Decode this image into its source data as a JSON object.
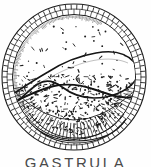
{
  "figure": {
    "title": "GASTRULA",
    "caption": "GASTRULA",
    "style": "black-and-white stippled line engraving",
    "background_color": "#fefefe",
    "ink_color": "#1a1a1a"
  },
  "diagram": {
    "type": "biological-cross-section",
    "outline_shape": "circle",
    "center_x": 74,
    "center_y": 77,
    "radius_x": 72,
    "radius_y": 73,
    "structures": [
      {
        "name": "ectoderm-outer-wall",
        "label": "outer cell layer",
        "description": "double-walled ring of rectangular epithelial cells forming the embryo surface"
      },
      {
        "name": "archenteron-cavity",
        "label": "archenteron",
        "description": "large pale curved interior cavity outlined by a heavy dark line, occupying the upper-left interior"
      },
      {
        "name": "yolk-mass",
        "label": "yolk / endoderm",
        "description": "stippled granular region filling the lower and right interior"
      },
      {
        "name": "blastopore-lip",
        "label": "blastopore",
        "description": "thickened multi-layered cell mass at the bottom of the sphere"
      }
    ],
    "cell_ring": {
      "cell_count": 78,
      "inner_ring_count": 70,
      "wall_thickness": 11
    },
    "stipple": {
      "dot_count": 420,
      "dot_size_min": 0.8,
      "dot_size_max": 2.2
    }
  }
}
